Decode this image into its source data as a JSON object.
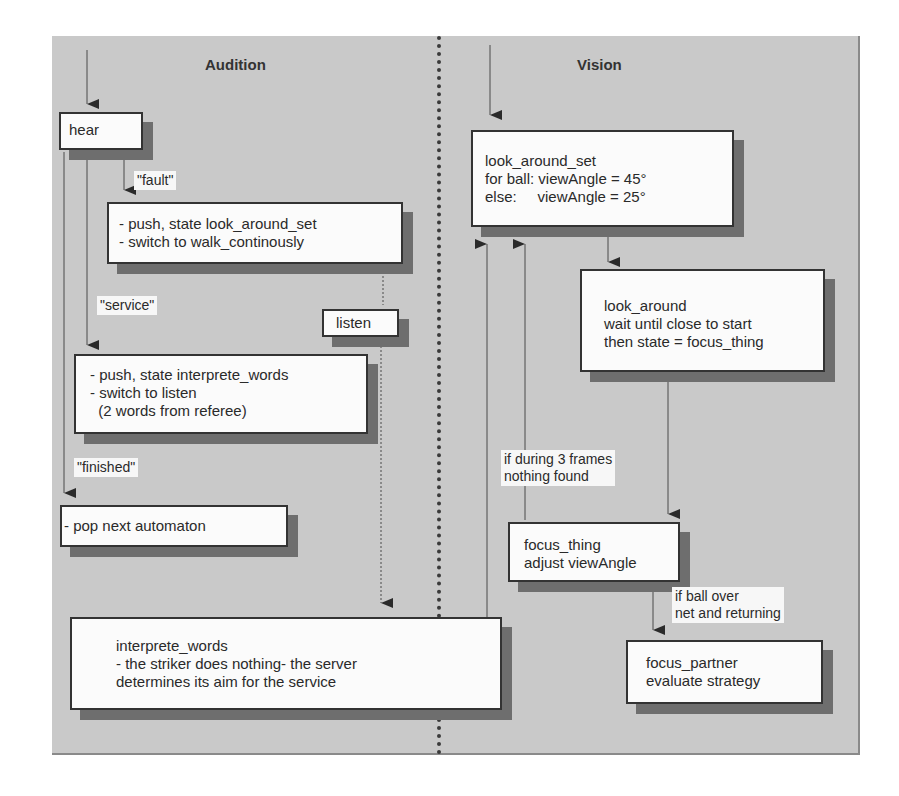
{
  "lanes": {
    "left_title": "Audition",
    "right_title": "Vision"
  },
  "audition": {
    "hear": "hear",
    "label_fault": "\"fault\"",
    "box_fault": "- push, state look_around_set\n- switch to walk_continously",
    "label_service": "\"service\"",
    "listen": "listen",
    "box_service": "- push, state interprete_words\n- switch to listen\n  (2 words from referee)",
    "label_finished": "\"finished\"",
    "box_finished": "- pop next automaton",
    "interprete_words": "interprete_words\n- the striker does nothing- the server\ndetermines its aim for the service"
  },
  "vision": {
    "look_around_set": "look_around_set\nfor ball: viewAngle = 45°\nelse:     viewAngle = 25°",
    "look_around": "look_around\nwait until close to start\nthen state = focus_thing",
    "label_nothing_found": "if during 3 frames\nnothing found",
    "focus_thing": "focus_thing\nadjust viewAngle",
    "label_ball_over": "if ball over\nnet and returning",
    "focus_partner": "focus_partner\nevaluate strategy"
  },
  "colors": {
    "panel_bg": "#c9c9c9",
    "box_bg": "#fbfbfb",
    "shadow": "#6e6e6e",
    "line": "#333333"
  }
}
